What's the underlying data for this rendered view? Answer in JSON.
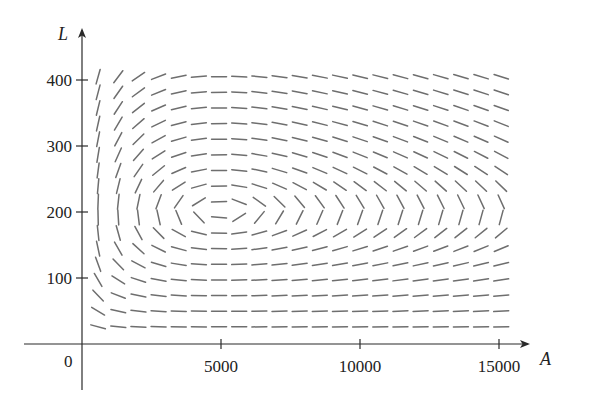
{
  "chart_data": {
    "type": "direction-field",
    "title": "",
    "xlabel": "A",
    "ylabel": "L",
    "origin_label": "0",
    "x_ticks": [
      {
        "value": 5000,
        "label": "5000"
      },
      {
        "value": 10000,
        "label": "10000"
      },
      {
        "value": 15000,
        "label": "15000"
      }
    ],
    "y_ticks": [
      {
        "value": 100,
        "label": "100"
      },
      {
        "value": 200,
        "label": "200"
      },
      {
        "value": 300,
        "label": "300"
      },
      {
        "value": 400,
        "label": "400"
      }
    ],
    "xlim": [
      -1800,
      16500
    ],
    "ylim": [
      -80,
      435
    ],
    "grid": false,
    "legend": null,
    "system": {
      "dA_dt": "2A - 0.01AL",
      "dL_dt": "-0.5L + 0.0001AL",
      "equilibrium": {
        "A": 5000,
        "L": 200
      }
    },
    "field_grid": {
      "A_start": 580,
      "A_end": 15080,
      "A_count": 21,
      "L_start": 26,
      "L_end": 405,
      "L_count": 17
    },
    "segment_color": "#6e6e6e",
    "axis_color": "#2a2a2a"
  }
}
